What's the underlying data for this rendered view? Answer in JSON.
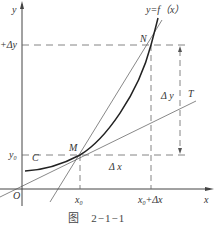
{
  "figure": {
    "caption_prefix": "图",
    "caption_number": "2−1−1",
    "labels": {
      "y_axis": "y",
      "x_axis": "x",
      "origin": "O",
      "curve": "y=f（x）",
      "point_n": "N",
      "point_m": "M",
      "point_c": "C",
      "tangent": "T",
      "y0": "y",
      "y0_sub": "0",
      "y0_plus_dy": "+Δy",
      "x0": "x",
      "x0_sub": "0",
      "x0_plus_dx_base": "x",
      "x0_plus_dx_sub": "0",
      "x0_plus_dx_suffix": "+Δx",
      "delta_y": "Δ y",
      "delta_x": "Δ x"
    },
    "colors": {
      "curve": "#222222",
      "axis": "#444444",
      "lines": "#555555",
      "dashed": "#666666"
    }
  }
}
